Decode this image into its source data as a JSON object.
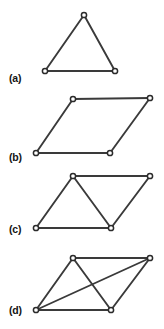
{
  "figure": {
    "background_color": "#ffffff",
    "edge_color": "#3a3a3a",
    "node_fill_color": "#ffffff",
    "node_stroke_color": "#2b2b2b",
    "label_color": "#141414",
    "node_radius": 2.6,
    "panels": [
      {
        "label": "(a)",
        "label_x": 9,
        "label_y": 82,
        "shape_name": "triangle",
        "vertex_count": 3,
        "edge_count": 3,
        "vertices": [
          {
            "id": "a1",
            "x": 84,
            "y": 15
          },
          {
            "id": "a2",
            "x": 45,
            "y": 71
          },
          {
            "id": "a3",
            "x": 115,
            "y": 71
          }
        ],
        "edges": [
          {
            "from": "a1",
            "to": "a2"
          },
          {
            "from": "a1",
            "to": "a3"
          },
          {
            "from": "a2",
            "to": "a3"
          }
        ]
      },
      {
        "label": "(b)",
        "label_x": 9,
        "label_y": 161,
        "shape_name": "parallelogram",
        "vertex_count": 4,
        "edge_count": 4,
        "vertices": [
          {
            "id": "b1",
            "x": 73,
            "y": 99
          },
          {
            "id": "b2",
            "x": 150,
            "y": 98
          },
          {
            "id": "b3",
            "x": 36,
            "y": 153
          },
          {
            "id": "b4",
            "x": 110,
            "y": 153
          }
        ],
        "edges": [
          {
            "from": "b1",
            "to": "b2"
          },
          {
            "from": "b1",
            "to": "b3"
          },
          {
            "from": "b2",
            "to": "b4"
          },
          {
            "from": "b3",
            "to": "b4"
          }
        ]
      },
      {
        "label": "(c)",
        "label_x": 9,
        "label_y": 233,
        "shape_name": "parallelogram-with-one-diagonal",
        "vertex_count": 4,
        "edge_count": 5,
        "vertices": [
          {
            "id": "c1",
            "x": 73,
            "y": 176
          },
          {
            "id": "c2",
            "x": 150,
            "y": 176
          },
          {
            "id": "c3",
            "x": 36,
            "y": 228
          },
          {
            "id": "c4",
            "x": 111,
            "y": 228
          }
        ],
        "edges": [
          {
            "from": "c1",
            "to": "c2"
          },
          {
            "from": "c1",
            "to": "c3"
          },
          {
            "from": "c2",
            "to": "c4"
          },
          {
            "from": "c3",
            "to": "c4"
          },
          {
            "from": "c1",
            "to": "c4"
          }
        ]
      },
      {
        "label": "(d)",
        "label_x": 9,
        "label_y": 314,
        "shape_name": "complete-graph-k4",
        "vertex_count": 4,
        "edge_count": 6,
        "vertices": [
          {
            "id": "d1",
            "x": 73,
            "y": 258
          },
          {
            "id": "d2",
            "x": 150,
            "y": 258
          },
          {
            "id": "d3",
            "x": 36,
            "y": 310
          },
          {
            "id": "d4",
            "x": 111,
            "y": 310
          }
        ],
        "edges": [
          {
            "from": "d1",
            "to": "d2"
          },
          {
            "from": "d1",
            "to": "d3"
          },
          {
            "from": "d2",
            "to": "d4"
          },
          {
            "from": "d3",
            "to": "d4"
          },
          {
            "from": "d1",
            "to": "d4"
          },
          {
            "from": "d2",
            "to": "d3"
          }
        ]
      }
    ]
  }
}
